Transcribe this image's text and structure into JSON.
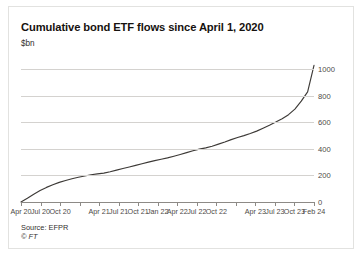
{
  "chart_data": {
    "type": "line",
    "title": "Cumulative bond ETF flows since April 1, 2020",
    "subtitle": "$bn",
    "xlabel": "",
    "ylabel": "$bn",
    "ylim": [
      0,
      1100
    ],
    "yticks": [
      0,
      200,
      400,
      600,
      800,
      1000
    ],
    "ytick_labels": [
      "0",
      "200",
      "400",
      "600",
      "800",
      "1000"
    ],
    "grid": true,
    "legend": "none",
    "axis_label_position": "right",
    "line_color": "#3d3a37",
    "xtick_labels": [
      "Apr 20",
      "Jul 20",
      "Oct 20",
      "",
      "Apr 21",
      "Jul 21",
      "Oct 21",
      "Jan 22",
      "Apr 22",
      "Jul 22",
      "Oct 22",
      "",
      "Apr 23",
      "Jul 23",
      "Oct 23",
      "Feb 24"
    ],
    "x": [
      "Apr 20",
      "May 20",
      "Jun 20",
      "Jul 20",
      "Aug 20",
      "Sep 20",
      "Oct 20",
      "Nov 20",
      "Dec 20",
      "Jan 21",
      "Feb 21",
      "Mar 21",
      "Apr 21",
      "May 21",
      "Jun 21",
      "Jul 21",
      "Aug 21",
      "Sep 21",
      "Oct 21",
      "Nov 21",
      "Dec 21",
      "Jan 22",
      "Feb 22",
      "Mar 22",
      "Apr 22",
      "May 22",
      "Jun 22",
      "Jul 22",
      "Aug 22",
      "Sep 22",
      "Oct 22",
      "Nov 22",
      "Dec 22",
      "Jan 23",
      "Feb 23",
      "Mar 23",
      "Apr 23",
      "May 23",
      "Jun 23",
      "Jul 23",
      "Aug 23",
      "Sep 23",
      "Oct 23",
      "Nov 23",
      "Dec 23",
      "Jan 24",
      "Feb 24"
    ],
    "values": [
      0,
      28,
      58,
      86,
      110,
      130,
      148,
      162,
      175,
      186,
      196,
      205,
      212,
      218,
      228,
      240,
      252,
      264,
      276,
      288,
      300,
      312,
      322,
      332,
      345,
      358,
      372,
      386,
      398,
      408,
      420,
      436,
      452,
      470,
      486,
      500,
      516,
      534,
      556,
      578,
      602,
      628,
      658,
      700,
      760,
      830,
      1030
    ],
    "annotations": []
  },
  "footer": {
    "source": "Source: EFPR",
    "copyright": "© FT"
  }
}
